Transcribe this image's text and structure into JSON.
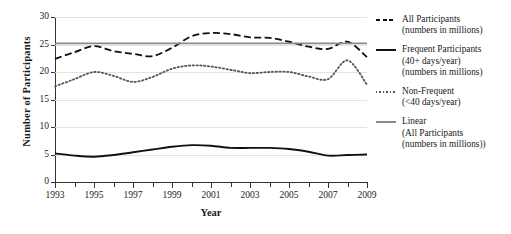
{
  "chart_data": {
    "type": "line",
    "title": "",
    "xlabel": "Year",
    "ylabel": "Number of Participants",
    "xlim": [
      1993,
      2009
    ],
    "ylim": [
      0,
      30
    ],
    "grid": true,
    "legend_position": "right",
    "xticks": [
      "1993",
      "1995",
      "1997",
      "1999",
      "2001",
      "2003",
      "2005",
      "2007",
      "2009"
    ],
    "yticks": [
      "0",
      "5",
      "10",
      "15",
      "20",
      "25",
      "30"
    ],
    "x": [
      1993,
      1994,
      1995,
      1996,
      1997,
      1998,
      1999,
      2000,
      2001,
      2002,
      2003,
      2004,
      2005,
      2006,
      2007,
      2008,
      2009
    ],
    "series": [
      {
        "name": "All Participants",
        "style": "dashed",
        "color": "#111111",
        "values": [
          22.4,
          23.6,
          24.7,
          23.8,
          23.3,
          22.9,
          24.4,
          26.5,
          27.1,
          26.9,
          26.3,
          26.2,
          25.5,
          24.6,
          24.2,
          25.5,
          22.7
        ]
      },
      {
        "name": "Frequent Participants",
        "style": "solid",
        "color": "#111111",
        "values": [
          5.2,
          4.8,
          4.6,
          4.9,
          5.4,
          5.9,
          6.4,
          6.7,
          6.6,
          6.2,
          6.2,
          6.2,
          6.0,
          5.5,
          4.8,
          4.9,
          5.0
        ]
      },
      {
        "name": "Non-Frequent",
        "style": "dotted",
        "color": "#555555",
        "values": [
          17.4,
          18.7,
          20.0,
          19.3,
          18.2,
          19.1,
          20.6,
          21.2,
          21.0,
          20.4,
          19.8,
          20.0,
          20.0,
          19.2,
          18.7,
          22.1,
          17.7
        ]
      },
      {
        "name": "Linear (All Participants)",
        "style": "trend",
        "color": "#8a8a8a",
        "values": [
          25.2,
          25.2,
          25.2,
          25.2,
          25.2,
          25.2,
          25.2,
          25.2,
          25.2,
          25.2,
          25.2,
          25.2,
          25.2,
          25.2,
          25.2,
          25.2,
          25.2
        ]
      }
    ]
  },
  "legend": {
    "entries": [
      {
        "swatch": "sw-dashed",
        "lines": [
          "All Participants",
          "(numbers in millions)"
        ]
      },
      {
        "swatch": "sw-solid",
        "lines": [
          "Frequent Participants",
          "(40+ days/year)",
          "(numbers in millions)"
        ]
      },
      {
        "swatch": "sw-dotted",
        "lines": [
          "Non-Frequent",
          "(<40 days/year)"
        ]
      },
      {
        "swatch": "sw-linear",
        "lines": [
          "Linear",
          "(All Participants",
          "(numbers in millions))"
        ]
      }
    ]
  }
}
